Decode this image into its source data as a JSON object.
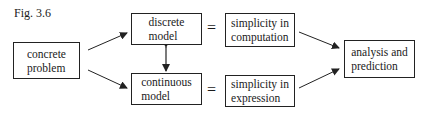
{
  "figure": {
    "label": "Fig. 3.6"
  },
  "nodes": {
    "concrete_problem": {
      "line1": "concrete",
      "line2": "problem"
    },
    "discrete_model": {
      "line1": "discrete",
      "line2": "model"
    },
    "continuous_model": {
      "line1": "continuous",
      "line2": "model"
    },
    "simplicity_computation": {
      "line1": "simplicity in",
      "line2": "computation"
    },
    "simplicity_expression": {
      "line1": "simplicity in",
      "line2": "expression"
    },
    "analysis_prediction": {
      "line1": "analysis and",
      "line2": "prediction"
    }
  },
  "relations": {
    "equals_top": "=",
    "equals_bottom": "="
  },
  "edges": [
    {
      "from": "concrete problem",
      "to": "discrete model",
      "type": "arrow"
    },
    {
      "from": "concrete problem",
      "to": "continuous model",
      "type": "arrow"
    },
    {
      "from": "discrete model",
      "to": "continuous model",
      "type": "double-arrow"
    },
    {
      "from": "discrete model",
      "to": "simplicity in computation",
      "type": "equals"
    },
    {
      "from": "continuous model",
      "to": "simplicity in expression",
      "type": "equals"
    },
    {
      "from": "simplicity in computation",
      "to": "analysis and prediction",
      "type": "arrow"
    },
    {
      "from": "simplicity in expression",
      "to": "analysis and prediction",
      "type": "arrow"
    }
  ]
}
